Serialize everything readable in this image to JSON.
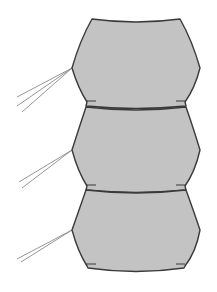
{
  "diagram": {
    "title": "",
    "colors": {
      "background": "#ffffff",
      "segment_fill": "#c3c3c3",
      "segment_stroke": "#3a3a3a",
      "setae_stroke": "#8a8a8a"
    },
    "segments": [
      {
        "id": "segment-1",
        "path": "M92,19 Q136,25 180,19 Q192,40 200,68 Q195,88 185,102 L186,106 Q136,111 86,106 L87,102 Q78,88 72,68 Q80,40 92,19 Z",
        "notches": [
          [
            86,
            101,
            96,
            101
          ],
          [
            185,
            101,
            176,
            101
          ]
        ],
        "setae_origin": [
          72,
          68
        ],
        "setae_tips": [
          [
            17,
            97
          ],
          [
            17,
            106
          ],
          [
            22,
            112
          ]
        ]
      },
      {
        "id": "segment-2",
        "path": "M86,107 Q136,113 186,107 Q194,130 200,150 Q195,172 185,186 L186,190 Q136,195 86,190 L87,186 Q78,172 72,150 Q79,128 86,107 Z",
        "notches": [
          [
            86,
            185,
            96,
            185
          ],
          [
            185,
            185,
            176,
            185
          ]
        ],
        "setae_origin": [
          72,
          150
        ],
        "setae_tips": [
          [
            19,
            182
          ],
          [
            22,
            188
          ]
        ]
      },
      {
        "id": "segment-3",
        "path": "M86,190 Q136,196 186,190 Q194,212 200,230 Q196,252 185,266 L184,268 Q136,275 88,268 L87,266 Q78,252 72,230 Q79,210 86,190 Z",
        "notches": [
          [
            86,
            264,
            96,
            264
          ],
          [
            185,
            264,
            176,
            264
          ]
        ],
        "setae_origin": [
          72,
          230
        ],
        "setae_tips": [
          [
            17,
            259
          ],
          [
            21,
            262
          ]
        ]
      }
    ]
  }
}
